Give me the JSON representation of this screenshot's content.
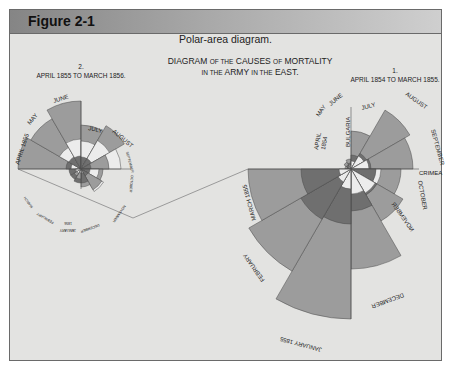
{
  "header": {
    "title": "Figure 2-1"
  },
  "caption": "Polar-area diagram.",
  "main_title": {
    "line1": [
      "DIAGRAM",
      "OF THE",
      "CAUSES",
      "OF",
      "MORTALITY"
    ],
    "line2": [
      "IN THE",
      "ARMY",
      "IN THE",
      "EAST."
    ]
  },
  "chart_data": [
    {
      "type": "polar-area",
      "title": "1. APRIL 1854 TO MARCH 1855.",
      "number": "1.",
      "period": "APRIL 1854 TO MARCH 1855.",
      "center": [
        351,
        169
      ],
      "start_angle_deg": 180,
      "months": [
        "APRIL 1854",
        "MAY",
        "JUNE",
        "JULY",
        "AUGUST",
        "SEPTEMBER",
        "OCTOBER",
        "NOVEMBER",
        "DECEMBER",
        "JANUARY 1855",
        "FEBRUARY",
        "MARCH 1855"
      ],
      "series": [
        {
          "name": "outer (disease)",
          "color": "#9c9c9c",
          "radii": [
            6,
            8,
            10,
            38,
            68,
            62,
            50,
            60,
            100,
            150,
            118,
            103
          ]
        },
        {
          "name": "middle (other causes)",
          "color": "#6f6f6f",
          "radii": [
            4,
            5,
            6,
            14,
            18,
            20,
            25,
            30,
            42,
            55,
            58,
            50
          ]
        },
        {
          "name": "inner (wounds)",
          "color": "#ececec",
          "radii": [
            2,
            3,
            4,
            8,
            15,
            18,
            30,
            28,
            25,
            20,
            15,
            12
          ]
        }
      ],
      "annotations": [
        "BULGARIA",
        "CRIMEA"
      ]
    },
    {
      "type": "polar-area",
      "title": "2. APRIL 1855 TO MARCH 1856.",
      "number": "2.",
      "period": "APRIL 1855 TO MARCH 1856.",
      "center": [
        81,
        169
      ],
      "start_angle_deg": 180,
      "months": [
        "APRIL 1855",
        "MAY",
        "JUNE",
        "JULY",
        "AUGUST",
        "SEPTEMBER",
        "OCTOBER",
        "NOVEMBER",
        "DECEMBER",
        "JANUARY 1856",
        "FEBRUARY",
        "MARCH"
      ],
      "series": [
        {
          "name": "outer (disease)",
          "color": "#9c9c9c",
          "radii": [
            63,
            58,
            68,
            44,
            50,
            28,
            22,
            24,
            18,
            10,
            8,
            6
          ]
        },
        {
          "name": "middle (other causes)",
          "color": "#6f6f6f",
          "radii": [
            15,
            14,
            13,
            12,
            12,
            10,
            9,
            8,
            14,
            14,
            12,
            12
          ]
        },
        {
          "name": "inner (wounds)",
          "color": "#ececec",
          "radii": [
            10,
            25,
            30,
            28,
            33,
            40,
            18,
            26,
            4,
            4,
            5,
            5
          ]
        }
      ],
      "labels_visible": [
        "APRIL 1855",
        "MAY",
        "JUNE",
        "JULY",
        "AUGUST",
        "SEPTEMBER",
        "OCTOBER",
        "NOVEMBER",
        "DECEMBER",
        "JANUARY 1856",
        "FEBRUARY",
        "MARCH"
      ]
    }
  ],
  "labels": {
    "c1": {
      "april": "APRIL",
      "year1854": "1854",
      "may": "MAY",
      "june": "JUNE",
      "bulgaria": "BULGARIA",
      "july": "JULY",
      "august": "AUGUST",
      "september": "SEPTEMBER",
      "crimea": "CRIMEA",
      "october": "OCTOBER",
      "november": "NOVEMBER",
      "december": "DECEMBER",
      "january": "JANUARY 1855",
      "february": "FEBRUARY",
      "march": "MARCH 1855"
    },
    "c2": {
      "april": "APRIL 1855",
      "may": "MAY",
      "june": "JUNE",
      "july": "JULY",
      "august": "AUGUST",
      "september": "SEPTEMBER",
      "october": "OCTOBER",
      "november": "NOVEMBER",
      "december": "DECEMBER",
      "january": "JANUARY",
      "year1856": "1856",
      "february": "FEBRUARY",
      "march": "MARCH"
    }
  }
}
